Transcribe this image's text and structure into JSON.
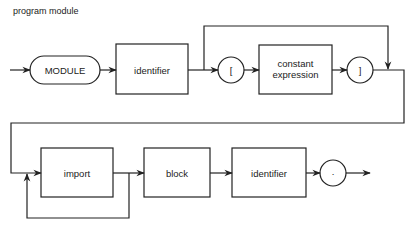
{
  "title": "program module",
  "nodes": {
    "module_kw": "MODULE",
    "identifier1": "identifier",
    "lbracket": "[",
    "const_expr_line1": "constant",
    "const_expr_line2": "expression",
    "rbracket": "]",
    "import": "import",
    "block": "block",
    "identifier2": "identifier",
    "period": "."
  }
}
